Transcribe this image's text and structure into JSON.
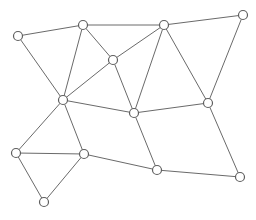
{
  "diagram": {
    "type": "undirected-graph",
    "colors": {
      "edge": "#6a6a6a",
      "node_stroke": "#5e5e5e",
      "node_fill": "#ffffff",
      "background": "#ffffff"
    },
    "nodes": [
      {
        "id": "A"
      },
      {
        "id": "B"
      },
      {
        "id": "C"
      },
      {
        "id": "D"
      },
      {
        "id": "E"
      },
      {
        "id": "F"
      },
      {
        "id": "G"
      },
      {
        "id": "H"
      },
      {
        "id": "I"
      },
      {
        "id": "J"
      },
      {
        "id": "K"
      },
      {
        "id": "L"
      },
      {
        "id": "M"
      }
    ],
    "edges": [
      [
        "A",
        "B"
      ],
      [
        "A",
        "F"
      ],
      [
        "B",
        "C"
      ],
      [
        "B",
        "E"
      ],
      [
        "B",
        "F"
      ],
      [
        "C",
        "D"
      ],
      [
        "C",
        "E"
      ],
      [
        "C",
        "G"
      ],
      [
        "C",
        "H"
      ],
      [
        "D",
        "H"
      ],
      [
        "E",
        "F"
      ],
      [
        "E",
        "G"
      ],
      [
        "F",
        "G"
      ],
      [
        "F",
        "I"
      ],
      [
        "F",
        "J"
      ],
      [
        "G",
        "H"
      ],
      [
        "G",
        "L"
      ],
      [
        "H",
        "M"
      ],
      [
        "I",
        "J"
      ],
      [
        "I",
        "K"
      ],
      [
        "J",
        "K"
      ],
      [
        "J",
        "L"
      ],
      [
        "L",
        "M"
      ]
    ]
  }
}
